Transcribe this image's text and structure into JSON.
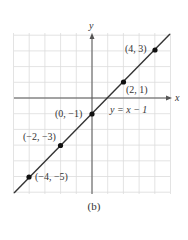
{
  "chart_data": {
    "type": "line",
    "title": "",
    "xlabel": "x",
    "ylabel": "y",
    "xlim": [
      -5,
      5
    ],
    "ylim": [
      -6,
      4
    ],
    "grid": true,
    "series": [
      {
        "name": "y = x − 1",
        "x": [
          -5,
          5
        ],
        "y": [
          -6,
          4
        ]
      }
    ],
    "points": [
      {
        "label": "(4, 3)",
        "x": 4,
        "y": 3
      },
      {
        "label": "(2, 1)",
        "x": 2,
        "y": 1
      },
      {
        "label": "(0, −1)",
        "x": 0,
        "y": -1
      },
      {
        "label": "(−2, −3)",
        "x": -2,
        "y": -3
      },
      {
        "label": "(−4, −5)",
        "x": -4,
        "y": -5
      }
    ],
    "annotations": [
      "y = x − 1"
    ]
  },
  "labels": {
    "x_axis": "x",
    "y_axis": "y",
    "equation": "y = x − 1",
    "p1": "(4, 3)",
    "p2": "(2, 1)",
    "p3": "(0, −1)",
    "p4": "(−2, −3)",
    "p5": "(−4, −5)",
    "caption": "(b)"
  },
  "colors": {
    "grid": "#dcdcdc",
    "axis": "#555555",
    "line": "#333333",
    "point": "#111111"
  }
}
